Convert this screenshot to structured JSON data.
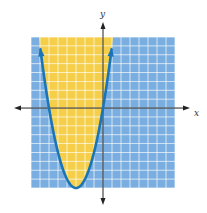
{
  "chart_data": {
    "type": "area",
    "title": "",
    "xlabel": "x",
    "ylabel": "y",
    "curve": {
      "equation": "y = x^2 + 6x",
      "vertex": [
        -3,
        -9
      ],
      "x_intercepts": [
        -6,
        0
      ],
      "line_style": "solid",
      "arrows_at_ends": true
    },
    "shaded_region": "above curve (inside parabola)",
    "grid": {
      "on": true,
      "xlim": [
        -8,
        8
      ],
      "ylim": [
        -9,
        8
      ],
      "cell": 1
    },
    "colors": {
      "grid_background": "#7aaee0",
      "grid_lines": "#ffffff",
      "shaded": "#f5cf4a",
      "curve": "#1a75b8",
      "axes": "#222222"
    }
  },
  "axes": {
    "x_label": "x",
    "y_label": "y"
  }
}
